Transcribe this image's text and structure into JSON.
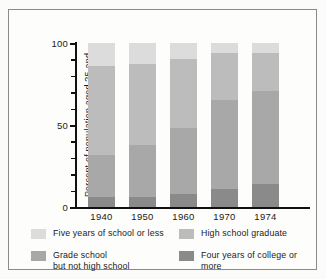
{
  "chart_data": {
    "type": "bar",
    "subtype": "stacked-bar-100-percent",
    "title": "",
    "xlabel": "",
    "ylabel": "Percent of population\naged 25 and older",
    "ylim": [
      0,
      100
    ],
    "yticks": [
      0,
      50,
      100
    ],
    "ytick_labels": [
      "0",
      "50",
      "100"
    ],
    "minor_tick_step": 10,
    "grid": false,
    "legend_position": "below",
    "categories": [
      "1940",
      "1950",
      "1960",
      "1970",
      "1974"
    ],
    "series": [
      {
        "name": "Four years of college or more",
        "color": "#8a8a8a",
        "values": [
          6,
          6,
          8,
          11,
          14
        ]
      },
      {
        "name": "Grade school but not high school",
        "color": "#a8a8a8",
        "values": [
          26,
          32,
          40,
          54,
          57
        ]
      },
      {
        "name": "High school graduate",
        "color": "#bcbcbc",
        "values": [
          54,
          49,
          42,
          29,
          23
        ]
      },
      {
        "name": "Five years of school or less",
        "color": "#dcdcdc",
        "values": [
          14,
          13,
          10,
          6,
          6
        ]
      }
    ]
  },
  "axis": {
    "y_title": "Percent of population\naged 25 and older",
    "y_labels": [
      "100",
      "50",
      "0"
    ],
    "x_labels": [
      "1940",
      "1950",
      "1960",
      "1970",
      "1974"
    ]
  },
  "legend": {
    "items": [
      {
        "label": "Five years of school or less",
        "color": "#dcdcdc"
      },
      {
        "label": "High school graduate",
        "color": "#bcbcbc"
      },
      {
        "label": "Grade school\nbut not high school",
        "color": "#a8a8a8"
      },
      {
        "label": "Four years of college or more",
        "color": "#8a8a8a"
      }
    ]
  },
  "colors": {
    "background": "#fdfdfb",
    "page": "#fbfbf9",
    "axis": "#111111",
    "frame": "#8a8a86",
    "text": "#1a1a1a"
  }
}
